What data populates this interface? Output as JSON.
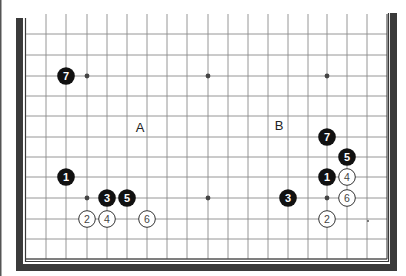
{
  "diagram": {
    "type": "go-board-partial",
    "view": "lower half of 19x19 board (rows extend off the top edge)",
    "grid": {
      "columns_x": [
        26,
        46,
        66,
        87,
        107,
        127,
        147,
        167,
        187,
        208,
        228,
        248,
        268,
        288,
        308,
        327,
        347,
        367,
        387
      ],
      "rows_y": [
        34,
        55,
        76,
        96,
        116,
        137,
        157,
        177,
        198,
        219,
        239,
        259
      ],
      "top_open_y": 14,
      "line_color": "#8a8a8a",
      "edge_line_color": "#333333"
    },
    "frame": {
      "color": "#3a3a3a",
      "gutter_line_color": "#444444"
    },
    "star_points": [
      {
        "col": 3,
        "row": 2
      },
      {
        "col": 9,
        "row": 2
      },
      {
        "col": 15,
        "row": 2
      },
      {
        "col": 3,
        "row": 8
      },
      {
        "col": 9,
        "row": 8
      },
      {
        "col": 15,
        "row": 8
      }
    ],
    "stones": [
      {
        "color": "black",
        "number": "7",
        "col": 2,
        "row": 2
      },
      {
        "color": "black",
        "number": "1",
        "col": 2,
        "row": 7
      },
      {
        "color": "black",
        "number": "3",
        "col": 4,
        "row": 8
      },
      {
        "color": "black",
        "number": "5",
        "col": 5,
        "row": 8
      },
      {
        "color": "white",
        "number": "2",
        "col": 3,
        "row": 9
      },
      {
        "color": "white",
        "number": "4",
        "col": 4,
        "row": 9
      },
      {
        "color": "white",
        "number": "6",
        "col": 6,
        "row": 9
      },
      {
        "color": "black",
        "number": "7",
        "col": 15,
        "row": 5
      },
      {
        "color": "black",
        "number": "5",
        "col": 16,
        "row": 6
      },
      {
        "color": "black",
        "number": "1",
        "col": 15,
        "row": 7
      },
      {
        "color": "white",
        "number": "4",
        "col": 16,
        "row": 7
      },
      {
        "color": "black",
        "number": "3",
        "col": 13,
        "row": 8
      },
      {
        "color": "white",
        "number": "6",
        "col": 16,
        "row": 8
      },
      {
        "color": "white",
        "number": "2",
        "col": 15,
        "row": 9
      }
    ],
    "labels": [
      {
        "text": "A",
        "x": 140,
        "y": 127
      },
      {
        "text": "B",
        "x": 279,
        "y": 125
      }
    ],
    "marks": [
      {
        "type": "small-dot",
        "x": 368,
        "y": 221
      }
    ]
  }
}
